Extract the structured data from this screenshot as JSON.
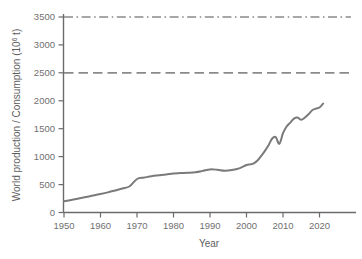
{
  "chart_data": {
    "type": "line",
    "title": "",
    "xlabel": "Year",
    "ylabel": "World production / Consumption (10⁶ t)",
    "ylabel_main": "World production / Consumption (10",
    "ylabel_sup": "6",
    "ylabel_tail": " t)",
    "xlim": [
      1950,
      2026
    ],
    "ylim": [
      0,
      3600
    ],
    "grid": false,
    "legend": "none",
    "xticks": [
      1950,
      1960,
      1970,
      1980,
      1990,
      2000,
      2010,
      2020
    ],
    "xtick_labels": [
      "1950",
      "1960",
      "1970",
      "1980",
      "1990",
      "2000",
      "2010",
      "2020"
    ],
    "yticks": [
      0,
      500,
      1000,
      1500,
      2000,
      2500,
      3000,
      3500
    ],
    "ytick_labels": [
      "0",
      "500",
      "1000",
      "1500",
      "2000",
      "2500",
      "3000",
      "3500"
    ],
    "series": [
      {
        "name": "World production / Consumption",
        "style": "solid",
        "color": "#7a7a7a",
        "x": [
          1950,
          1952,
          1954,
          1956,
          1958,
          1960,
          1962,
          1964,
          1966,
          1968,
          1970,
          1972,
          1974,
          1976,
          1978,
          1980,
          1982,
          1984,
          1986,
          1988,
          1990,
          1992,
          1994,
          1996,
          1998,
          2000,
          2001,
          2002,
          2003,
          2004,
          2005,
          2006,
          2007,
          2008,
          2009,
          2010,
          2011,
          2012,
          2013,
          2014,
          2015,
          2016,
          2017,
          2018,
          2019,
          2020,
          2021
        ],
        "values": [
          200,
          225,
          250,
          278,
          303,
          330,
          360,
          395,
          430,
          470,
          600,
          625,
          650,
          665,
          680,
          700,
          706,
          712,
          722,
          745,
          772,
          765,
          748,
          760,
          790,
          850,
          862,
          880,
          930,
          1010,
          1100,
          1200,
          1320,
          1350,
          1230,
          1420,
          1540,
          1610,
          1680,
          1700,
          1660,
          1700,
          1760,
          1830,
          1860,
          1880,
          1950
        ]
      },
      {
        "name": "Upper reference level",
        "style": "dashdot",
        "color": "#8a8a8a",
        "value": 3500
      },
      {
        "name": "Lower reference level",
        "style": "dashed",
        "color": "#8a8a8a",
        "value": 2500
      }
    ]
  }
}
